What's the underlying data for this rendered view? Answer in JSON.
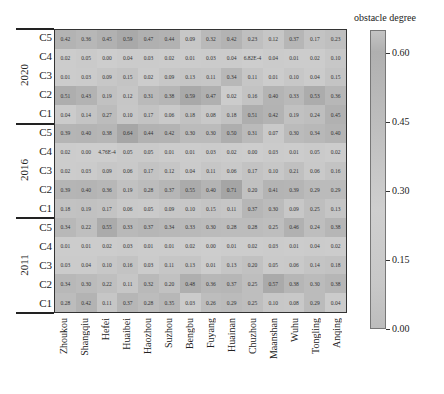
{
  "chart_data": {
    "type": "heatmap",
    "title": "",
    "colorbar_label": "obstacle degree",
    "colorbar_ticks": [
      "0.60",
      "0.45",
      "0.30",
      "0.15",
      "0.00"
    ],
    "colorbar_range": [
      0,
      0.65
    ],
    "x_labels": [
      "Zhoukou",
      "Shangqiu",
      "Hefei",
      "Huaibei",
      "Haozhou",
      "Suzhou",
      "Bengbu",
      "Fuyang",
      "Huainan",
      "Chuzhou",
      "Maanshan",
      "Wuhu",
      "Tongling",
      "Anqing"
    ],
    "year_groups": [
      {
        "year": "2020",
        "rows": [
          {
            "label": "C5",
            "values": [
              "0.42",
              "0.36",
              "0.45",
              "0.59",
              "0.47",
              "0.44",
              "0.09",
              "0.32",
              "0.42",
              "0.23",
              "0.12",
              "0.37",
              "0.17",
              "0.23"
            ]
          },
          {
            "label": "C4",
            "values": [
              "0.02",
              "0.05",
              "0.00",
              "0.04",
              "0.03",
              "0.02",
              "0.01",
              "0.03",
              "0.04",
              "6.82E-4",
              "0.04",
              "0.01",
              "0.02",
              "0.10"
            ]
          },
          {
            "label": "C3",
            "values": [
              "0.01",
              "0.03",
              "0.09",
              "0.15",
              "0.02",
              "0.09",
              "0.13",
              "0.11",
              "0.34",
              "0.11",
              "0.01",
              "0.10",
              "0.04",
              "0.15"
            ]
          },
          {
            "label": "C2",
            "values": [
              "0.51",
              "0.43",
              "0.19",
              "0.12",
              "0.31",
              "0.38",
              "0.59",
              "0.47",
              "0.02",
              "0.16",
              "0.40",
              "0.33",
              "0.53",
              "0.36"
            ]
          },
          {
            "label": "C1",
            "values": [
              "0.04",
              "0.14",
              "0.27",
              "0.10",
              "0.17",
              "0.06",
              "0.18",
              "0.08",
              "0.18",
              "0.51",
              "0.42",
              "0.19",
              "0.24",
              "0.45"
            ]
          }
        ]
      },
      {
        "year": "2016",
        "rows": [
          {
            "label": "C5",
            "values": [
              "0.39",
              "0.40",
              "0.38",
              "0.64",
              "0.44",
              "0.42",
              "0.30",
              "0.30",
              "0.50",
              "0.31",
              "0.07",
              "0.30",
              "0.34",
              "0.40"
            ]
          },
          {
            "label": "C4",
            "values": [
              "0.02",
              "0.00",
              "4.76E-4",
              "0.05",
              "0.05",
              "0.01",
              "0.01",
              "0.03",
              "0.02",
              "0.00",
              "0.03",
              "0.01",
              "0.05",
              "0.02"
            ]
          },
          {
            "label": "C3",
            "values": [
              "0.02",
              "0.03",
              "0.09",
              "0.06",
              "0.17",
              "0.12",
              "0.04",
              "0.11",
              "0.06",
              "0.17",
              "0.10",
              "0.21",
              "0.06",
              "0.16"
            ]
          },
          {
            "label": "C2",
            "values": [
              "0.39",
              "0.40",
              "0.36",
              "0.19",
              "0.28",
              "0.37",
              "0.55",
              "0.40",
              "0.71",
              "0.20",
              "0.41",
              "0.39",
              "0.29",
              "0.29"
            ]
          },
          {
            "label": "C1",
            "values": [
              "0.18",
              "0.19",
              "0.17",
              "0.06",
              "0.05",
              "0.09",
              "0.10",
              "0.15",
              "0.11",
              "0.37",
              "0.30",
              "0.09",
              "0.25",
              "0.13"
            ]
          }
        ]
      },
      {
        "year": "2011",
        "rows": [
          {
            "label": "C5",
            "values": [
              "0.34",
              "0.22",
              "0.55",
              "0.33",
              "0.37",
              "0.34",
              "0.33",
              "0.30",
              "0.28",
              "0.28",
              "0.25",
              "0.46",
              "0.24",
              "0.38"
            ]
          },
          {
            "label": "C4",
            "values": [
              "0.01",
              "0.01",
              "0.02",
              "0.03",
              "0.01",
              "0.01",
              "0.02",
              "0.00",
              "0.01",
              "0.02",
              "0.03",
              "0.01",
              "0.04",
              "0.02"
            ]
          },
          {
            "label": "C3",
            "values": [
              "0.03",
              "0.04",
              "0.10",
              "0.16",
              "0.03",
              "0.11",
              "0.13",
              "0.01",
              "0.13",
              "0.20",
              "0.05",
              "0.06",
              "0.14",
              "0.18"
            ]
          },
          {
            "label": "C2",
            "values": [
              "0.34",
              "0.30",
              "0.22",
              "0.11",
              "0.32",
              "0.20",
              "0.48",
              "0.36",
              "0.37",
              "0.25",
              "0.57",
              "0.38",
              "0.30",
              "0.38"
            ]
          },
          {
            "label": "C1",
            "values": [
              "0.28",
              "0.42",
              "0.11",
              "0.37",
              "0.28",
              "0.35",
              "0.03",
              "0.26",
              "0.29",
              "0.25",
              "0.10",
              "0.08",
              "0.29",
              "0.04"
            ]
          }
        ]
      }
    ]
  }
}
